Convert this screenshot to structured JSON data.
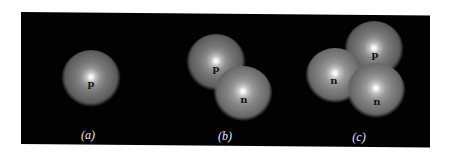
{
  "figure": {
    "background_color": "#020202",
    "page_color": "#ffffff",
    "sphere_color": "#6e6e6e",
    "highlight_color": "#ffffff",
    "label_color": "#151515",
    "caption_color": "#e8e8e8"
  },
  "panels": [
    {
      "id": "a",
      "caption": "(a)",
      "description": "single proton (hydrogen nucleus)",
      "nucleons": [
        {
          "type": "proton",
          "label": "p"
        }
      ]
    },
    {
      "id": "b",
      "caption": "(b)",
      "description": "proton and neutron (deuteron)",
      "nucleons": [
        {
          "type": "proton",
          "label": "p"
        },
        {
          "type": "neutron",
          "label": "n"
        }
      ]
    },
    {
      "id": "c",
      "caption": "(c)",
      "description": "one proton and two neutrons (triton)",
      "nucleons": [
        {
          "type": "proton",
          "label": "p"
        },
        {
          "type": "neutron",
          "label": "n"
        },
        {
          "type": "neutron",
          "label": "n"
        }
      ]
    }
  ]
}
